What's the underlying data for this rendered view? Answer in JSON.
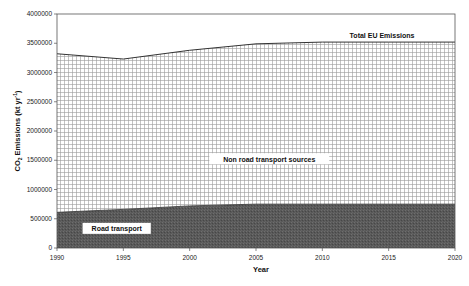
{
  "chart_data": {
    "type": "area",
    "title": "",
    "xlabel": "Year",
    "ylabel": "CO2 Emissions (kt yr-1)",
    "ylabel_parts": {
      "main": "CO",
      "sub": "2",
      "rest": " Emissions (kt yr",
      "sup": "-1",
      "end": ")"
    },
    "x": [
      1990,
      1995,
      2000,
      2005,
      2010,
      2015,
      2020
    ],
    "xlim": [
      1990,
      2020
    ],
    "ylim": [
      0,
      4000000
    ],
    "x_ticks": [
      "1990",
      "1995",
      "2000",
      "2005",
      "2010",
      "2015",
      "2020"
    ],
    "y_ticks": [
      "0",
      "500000",
      "1000000",
      "1500000",
      "2000000",
      "2500000",
      "3000000",
      "3500000",
      "4000000"
    ],
    "y_tick_values": [
      0,
      500000,
      1000000,
      1500000,
      2000000,
      2500000,
      3000000,
      3500000,
      4000000
    ],
    "grid": false,
    "stacked": true,
    "series": [
      {
        "name": "Road transport",
        "fill": "#5a5a5a",
        "pattern": "dark-stipple",
        "values": [
          610000,
          660000,
          720000,
          750000,
          750000,
          750000,
          750000
        ]
      },
      {
        "name": "Non road transport sources",
        "fill": "#ffffff",
        "pattern": "grid-hatch",
        "values": [
          2710000,
          2570000,
          2660000,
          2740000,
          2770000,
          2770000,
          2770000
        ]
      },
      {
        "name": "Total EU Emissions",
        "line": "#333333",
        "values": [
          3320000,
          3230000,
          3380000,
          3490000,
          3520000,
          3520000,
          3520000
        ]
      }
    ],
    "annotations": [
      {
        "text": "Total EU Emissions",
        "x": 2014.5,
        "y": 3620000
      },
      {
        "text": "Non road transport sources",
        "x": 2006,
        "y": 1500000
      },
      {
        "text": "Road transport",
        "x": 1994.5,
        "y": 310000
      }
    ]
  }
}
